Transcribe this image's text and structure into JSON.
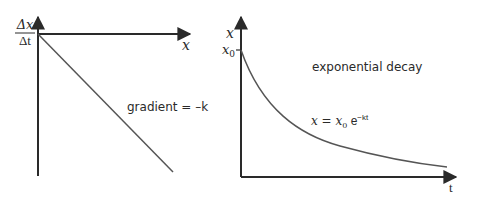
{
  "diagram": {
    "left_graph": {
      "y_label_numerator": "Δx",
      "y_label_denominator": "Δt",
      "x_label": "x",
      "annotation": "gradient = –k",
      "line": {
        "type": "straight",
        "from": [
          38,
          34
        ],
        "to": [
          173,
          172
        ],
        "color": "#555555"
      }
    },
    "right_graph": {
      "y_label": "x",
      "y_tick_label_base": "x",
      "y_tick_label_sub": "0",
      "x_label": "t",
      "title": "exponential decay",
      "formula_lhs": "x = ",
      "formula_x": "x",
      "formula_sub": "0",
      "formula_e": " e",
      "formula_exp": "−kt",
      "curve": {
        "type": "exponential-decay",
        "color": "#555555"
      }
    },
    "colors": {
      "axis": "#2a2a2a",
      "line": "#555555",
      "text": "#2a2a2a",
      "background": "#ffffff"
    }
  }
}
